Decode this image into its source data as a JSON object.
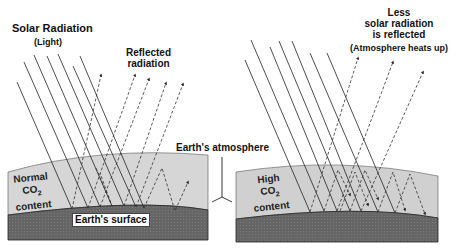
{
  "diagram": {
    "left_panel": {
      "title": "Solar Radiation",
      "title_sub": "(Light)",
      "reflected_label_line1": "Reflected",
      "reflected_label_line2": "radiation",
      "co2_line1": "Normal",
      "co2_line2": "CO",
      "co2_subscript": "2",
      "co2_line3": "content",
      "surface_label": "Earth's surface"
    },
    "center": {
      "atmosphere_label": "Earth's atmosphere"
    },
    "right_panel": {
      "note_line1": "Less",
      "note_line2": "solar radiation",
      "note_line3": "is reflected",
      "note_sub": "(Atmosphere heats up)",
      "co2_line1": "High",
      "co2_line2": "CO",
      "co2_subscript": "2",
      "co2_line3": "content"
    },
    "colors": {
      "atmosphere": "#d4d4d4",
      "ground": "#6a6a6a",
      "line": "#222222"
    }
  }
}
